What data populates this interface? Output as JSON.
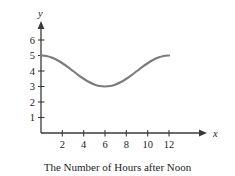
{
  "chart_data": {
    "type": "line",
    "title": "",
    "caption": "The Number of Hours after Noon",
    "xlabel": "The Number of Hours after Noon",
    "ylabel": "Depth (feet)",
    "x_axis_name": "x",
    "y_axis_name": "y",
    "xlim": [
      0,
      13.2
    ],
    "ylim": [
      0,
      6.8
    ],
    "grid": false,
    "legend": null,
    "curve_color": "#7b7b7b",
    "axis_color": "#3a3a3a",
    "x_ticks": [
      {
        "value": 2,
        "label": "2"
      },
      {
        "value": 4,
        "label": "4"
      },
      {
        "value": 6,
        "label": "6"
      },
      {
        "value": 8,
        "label": "8"
      },
      {
        "value": 10,
        "label": "10"
      },
      {
        "value": 12,
        "label": "12"
      }
    ],
    "y_ticks": [
      {
        "value": 1,
        "label": "1"
      },
      {
        "value": 2,
        "label": "2"
      },
      {
        "value": 3,
        "label": "3"
      },
      {
        "value": 4,
        "label": "4"
      },
      {
        "value": 5,
        "label": "5"
      },
      {
        "value": 6,
        "label": "6"
      }
    ],
    "series": [
      {
        "name": "Depth",
        "x": [
          0,
          0.5,
          1,
          1.5,
          2,
          2.5,
          3,
          3.5,
          4,
          4.5,
          5,
          5.5,
          6,
          6.5,
          7,
          7.5,
          8,
          8.5,
          9,
          9.5,
          10,
          10.5,
          11,
          11.5,
          12
        ],
        "values": [
          5.0,
          4.97,
          4.87,
          4.71,
          4.5,
          4.26,
          4.0,
          3.74,
          3.5,
          3.29,
          3.13,
          3.03,
          3.0,
          3.03,
          3.13,
          3.29,
          3.5,
          3.74,
          4.0,
          4.26,
          4.5,
          4.71,
          4.87,
          4.97,
          5.0
        ]
      }
    ],
    "max_value": 5,
    "min_value": 3,
    "min_at_x": 6
  }
}
